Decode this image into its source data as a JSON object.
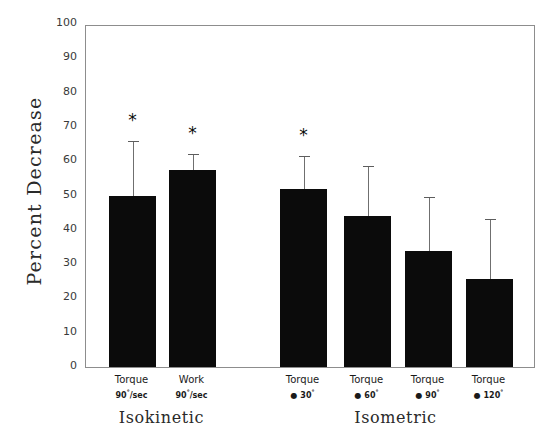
{
  "chart_data": {
    "type": "bar",
    "title": "",
    "xlabel": "",
    "ylabel": "Percent Decrease",
    "ylim": [
      0,
      100
    ],
    "yticks": [
      0,
      10,
      20,
      30,
      40,
      50,
      60,
      70,
      80,
      90,
      100
    ],
    "ytick_labels": [
      "0",
      "10",
      "20",
      "30",
      "40",
      "50",
      "60",
      "70",
      "80",
      "90",
      "100"
    ],
    "grid": false,
    "legend": "none",
    "categories": [
      "Torque 90°/sec",
      "Work 90°/sec",
      "Torque @ 30°",
      "Torque @ 60°",
      "Torque @ 90°",
      "Torque @ 120°"
    ],
    "values": [
      50.0,
      57.5,
      51.9,
      44.0,
      33.8,
      25.7
    ],
    "error_upper": [
      16.5,
      5.2,
      10.1,
      15.2,
      16.3,
      18.0
    ],
    "error_bar_tops": [
      66.5,
      62.7,
      62.0,
      59.2,
      50.1,
      43.7
    ],
    "significance": [
      "*",
      "*",
      "*",
      "",
      "",
      ""
    ],
    "bars": [
      {
        "id": "bar-torque-90-sec",
        "value": 50.0,
        "error_top": 66.5,
        "significance": "*",
        "label_line1": "Torque",
        "label_line2_main": "90",
        "label_line2_sup": "°",
        "label_line2_tail": "/sec",
        "group": "Isokinetic"
      },
      {
        "id": "bar-work-90-sec",
        "value": 57.5,
        "error_top": 62.7,
        "significance": "*",
        "label_line1": "Work",
        "label_line2_main": "90",
        "label_line2_sup": "°",
        "label_line2_tail": "/sec",
        "group": "Isokinetic"
      },
      {
        "id": "bar-torque-at-30",
        "value": 51.9,
        "error_top": 62.0,
        "significance": "*",
        "label_line1": "Torque",
        "label_line2_main": "● 30",
        "label_line2_sup": "°",
        "label_line2_tail": "",
        "group": "Isometric"
      },
      {
        "id": "bar-torque-at-60",
        "value": 44.0,
        "error_top": 59.2,
        "significance": "",
        "label_line1": "Torque",
        "label_line2_main": "● 60",
        "label_line2_sup": "°",
        "label_line2_tail": "",
        "group": "Isometric"
      },
      {
        "id": "bar-torque-at-90",
        "value": 33.8,
        "error_top": 50.1,
        "significance": "",
        "label_line1": "Torque",
        "label_line2_main": "● 90",
        "label_line2_sup": "°",
        "label_line2_tail": "",
        "group": "Isometric"
      },
      {
        "id": "bar-torque-at-120",
        "value": 25.7,
        "error_top": 43.7,
        "significance": "",
        "label_line1": "Torque",
        "label_line2_main": "● 120",
        "label_line2_sup": "°",
        "label_line2_tail": "",
        "group": "Isometric"
      }
    ],
    "groups": [
      {
        "id": "group-isokinetic",
        "label": "Isokinetic",
        "bar_indices": [
          0,
          1
        ]
      },
      {
        "id": "group-isometric",
        "label": "Isometric",
        "bar_indices": [
          2,
          3,
          4,
          5
        ]
      }
    ],
    "colors": {
      "bar_fill": "#0b0b0b",
      "axis": "#8d8d8d",
      "error_bar": "#6f6f6f",
      "text": "#1a1a1a",
      "background": "#ffffff"
    }
  }
}
